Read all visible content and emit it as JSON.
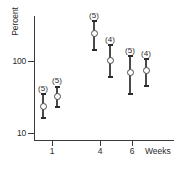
{
  "chart_data": {
    "type": "scatter",
    "title": "",
    "subtitle": "",
    "xlabel": "Weeks",
    "ylabel": "Percent",
    "yscale": "log",
    "ylim": [
      10,
      400
    ],
    "ytick_labels": [
      "100",
      "10"
    ],
    "ytick_values": [
      100,
      10
    ],
    "xlim": [
      0,
      7.6
    ],
    "xtick_labels": [
      "1",
      "4",
      "6"
    ],
    "xtick_values": [
      1,
      4,
      6
    ],
    "grid": false,
    "legend": "none",
    "marker_style": "open-circle-with-error-bars",
    "annotation_note": "Parenthesised numbers above each point are sample sizes (n).",
    "points": [
      {
        "id": "p1",
        "x": 0.85,
        "y": 25,
        "y_low": 19,
        "y_high": 33,
        "label": "(5)",
        "n": 5
      },
      {
        "id": "p2",
        "x": 1.25,
        "y": 33,
        "y_low": 27,
        "y_high": 42,
        "label": "(5)",
        "n": 5
      },
      {
        "id": "p3",
        "x": 3.8,
        "y": 235,
        "y_low": 140,
        "y_high": 380,
        "label": "(5)",
        "n": 5
      },
      {
        "id": "p4",
        "x": 4.28,
        "y": 98,
        "y_low": 68,
        "y_high": 165,
        "label": "(4)",
        "n": 4
      },
      {
        "id": "p5",
        "x": 5.72,
        "y": 68,
        "y_low": 37,
        "y_high": 125,
        "label": "(5)",
        "n": 5
      },
      {
        "id": "p6",
        "x": 6.22,
        "y": 74,
        "y_low": 52,
        "y_high": 120,
        "label": "(4)",
        "n": 4
      }
    ]
  },
  "axes": {
    "y_title": "Percent",
    "x_title": "Weeks",
    "y_ticks": [
      {
        "label": "100",
        "top_px": 61
      },
      {
        "label": "10",
        "top_px": 133
      }
    ],
    "x_ticks": [
      {
        "label": "1",
        "left_px": 52
      },
      {
        "label": "4",
        "left_px": 100
      },
      {
        "label": "6",
        "left_px": 132
      }
    ]
  },
  "series_pixels": [
    {
      "id": "p1",
      "cx": 43,
      "marker_cy": 106,
      "top_cy": 93,
      "bot_cy": 117,
      "label": "(5)",
      "label_cy": 85
    },
    {
      "id": "p2",
      "cx": 57,
      "marker_cy": 96,
      "top_cy": 86,
      "bot_cy": 106,
      "label": "(5)",
      "label_cy": 77
    },
    {
      "id": "p3",
      "cx": 94,
      "marker_cy": 33,
      "top_cy": 20,
      "bot_cy": 49,
      "label": "(5)",
      "label_cy": 12
    },
    {
      "id": "p4",
      "cx": 110,
      "marker_cy": 60,
      "top_cy": 44,
      "bot_cy": 76,
      "label": "(4)",
      "label_cy": 36
    },
    {
      "id": "p5",
      "cx": 130,
      "marker_cy": 72,
      "top_cy": 55,
      "bot_cy": 93,
      "label": "(5)",
      "label_cy": 47
    },
    {
      "id": "p6",
      "cx": 146,
      "marker_cy": 70,
      "top_cy": 58,
      "bot_cy": 85,
      "label": "(4)",
      "label_cy": 50
    }
  ],
  "colors": {
    "axis": "#3a3a3a",
    "marker": "#4a4a4a",
    "text": "#2b2b2b",
    "background": "#ffffff"
  }
}
